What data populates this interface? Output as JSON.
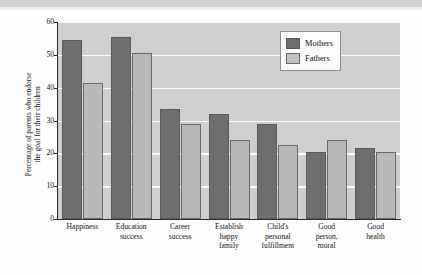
{
  "figure": {
    "background_color": "#fdfdfd",
    "plot_background_color": "#cfcfcf",
    "top_band_color": "#d2d2d2"
  },
  "legend": {
    "position": "top-right",
    "entries": [
      {
        "label": "Mothers",
        "color": "#6e6e6e"
      },
      {
        "label": "Fathers",
        "color": "#b9b9b9"
      }
    ]
  },
  "axis": {
    "ylabel_line1": "Percentage of parents who endorse",
    "ylabel_line2": "the goal for their children",
    "yticks": [
      "60",
      "50",
      "40",
      "30",
      "20",
      "10",
      "0"
    ]
  },
  "chart_data": {
    "type": "bar",
    "title": "",
    "xlabel": "",
    "ylabel": "Percentage of parents who endorse the goal for their children",
    "ylim": [
      0,
      60
    ],
    "ytick_values": [
      0,
      10,
      20,
      30,
      40,
      50,
      60
    ],
    "grid": true,
    "legend_position": "top-right",
    "categories": [
      "Happiness",
      "Education success",
      "Career success",
      "Establish happy family",
      "Child's personal fulfillment",
      "Good person, moral",
      "Good health"
    ],
    "category_label_lines": [
      [
        "Happiness"
      ],
      [
        "Education",
        "success"
      ],
      [
        "Career",
        "success"
      ],
      [
        "Establish",
        "happy",
        "family"
      ],
      [
        "Child's",
        "personal",
        "fulfillment"
      ],
      [
        "Good",
        "person,",
        "moral"
      ],
      [
        "Good",
        "health"
      ]
    ],
    "series": [
      {
        "name": "Mothers",
        "color": "#6e6e6e",
        "values": [
          54.5,
          55.5,
          33.5,
          32.0,
          29.0,
          20.5,
          21.5
        ]
      },
      {
        "name": "Fathers",
        "color": "#b9b9b9",
        "values": [
          41.5,
          50.5,
          29.0,
          24.0,
          22.5,
          24.0,
          20.3
        ]
      }
    ]
  }
}
